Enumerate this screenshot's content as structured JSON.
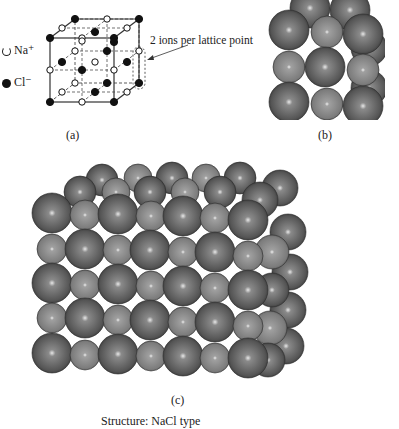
{
  "panel_a": {
    "caption": "(a)",
    "legend": [
      {
        "symbol": "open-circle",
        "label": "Na⁺"
      },
      {
        "symbol": "filled-circle",
        "label": "Cl⁻"
      }
    ],
    "annotation": "2 ions per lattice point"
  },
  "panel_b": {
    "caption": "(b)"
  },
  "panel_c": {
    "caption": "(c)"
  },
  "footer": {
    "text": "Structure: NaCl type"
  },
  "colors": {
    "large_ion": "#555555",
    "small_ion": "#8a8a8a",
    "line": "#333333"
  }
}
